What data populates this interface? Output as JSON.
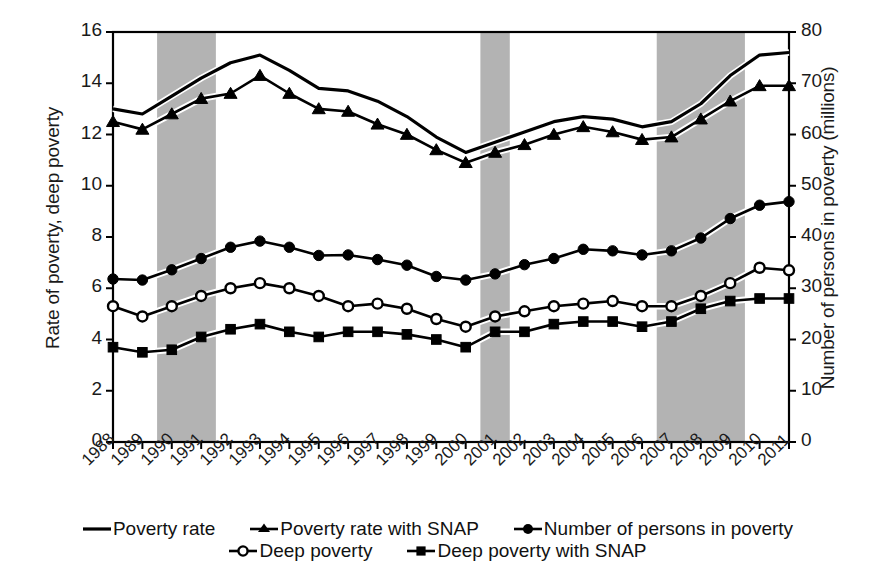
{
  "chart_data": {
    "type": "line",
    "title": "",
    "xlabel": "",
    "ylabel": "Rate of poverty, deep poverty",
    "ylabel_right": "Number of persons in poverty (millions)",
    "ylim": [
      0,
      16
    ],
    "yticks": [
      0,
      2,
      4,
      6,
      8,
      10,
      12,
      14,
      16
    ],
    "ylim_right": [
      0,
      80
    ],
    "yticks_right": [
      0,
      10,
      20,
      30,
      40,
      50,
      60,
      70,
      80
    ],
    "grid": false,
    "legend_position": "bottom",
    "categories": [
      "1988",
      "1989",
      "1990",
      "1991",
      "1992",
      "1993",
      "1994",
      "1995",
      "1996",
      "1997",
      "1998",
      "1999",
      "2000",
      "2001",
      "2002",
      "2003",
      "2004",
      "2005",
      "2006",
      "2007",
      "2008",
      "2009",
      "2010",
      "2011"
    ],
    "shaded_regions": [
      {
        "label": "recession-1990-1991",
        "start": "1990",
        "end": "1991",
        "color": "#b3b3b3"
      },
      {
        "label": "recession-2001",
        "start": "2001",
        "end": "2001",
        "color": "#b3b3b3"
      },
      {
        "label": "recession-2007-2009",
        "start": "2007",
        "end": "2009",
        "color": "#b3b3b3"
      }
    ],
    "series": [
      {
        "name": "Poverty rate",
        "key": "poverty-rate",
        "axis": "left",
        "marker": "none",
        "values": [
          13.0,
          12.8,
          13.5,
          14.2,
          14.8,
          15.1,
          14.5,
          13.8,
          13.7,
          13.3,
          12.7,
          11.9,
          11.3,
          11.7,
          12.1,
          12.5,
          12.7,
          12.6,
          12.3,
          12.5,
          13.2,
          14.3,
          15.1,
          15.2
        ]
      },
      {
        "name": "Poverty rate with SNAP",
        "key": "poverty-rate-with-snap",
        "axis": "left",
        "marker": "triangle",
        "values": [
          12.5,
          12.2,
          12.8,
          13.4,
          13.6,
          14.3,
          13.6,
          13.0,
          12.9,
          12.4,
          12.0,
          11.4,
          10.9,
          11.3,
          11.6,
          12.0,
          12.3,
          12.1,
          11.8,
          11.9,
          12.6,
          13.3,
          13.9,
          13.9
        ]
      },
      {
        "name": "Number of persons in poverty",
        "key": "number-of-persons-in-poverty",
        "axis": "right",
        "marker": "circle-filled",
        "values": [
          31.8,
          31.6,
          33.6,
          35.8,
          38.0,
          39.2,
          38.0,
          36.4,
          36.5,
          35.6,
          34.5,
          32.3,
          31.6,
          32.8,
          34.6,
          35.8,
          37.6,
          37.3,
          36.5,
          37.3,
          39.8,
          43.6,
          46.2,
          46.9
        ]
      },
      {
        "name": "Deep poverty",
        "key": "deep-poverty",
        "axis": "left",
        "marker": "circle-open",
        "values": [
          5.3,
          4.9,
          5.3,
          5.7,
          6.0,
          6.2,
          6.0,
          5.7,
          5.3,
          5.4,
          5.2,
          4.8,
          4.5,
          4.9,
          5.1,
          5.3,
          5.4,
          5.5,
          5.3,
          5.3,
          5.7,
          6.2,
          6.8,
          6.7
        ]
      },
      {
        "name": "Deep poverty with SNAP",
        "key": "deep-poverty-with-snap",
        "axis": "left",
        "marker": "square-filled",
        "values": [
          3.7,
          3.5,
          3.6,
          4.1,
          4.4,
          4.6,
          4.3,
          4.1,
          4.3,
          4.3,
          4.2,
          4.0,
          3.7,
          4.3,
          4.3,
          4.6,
          4.7,
          4.7,
          4.5,
          4.7,
          5.2,
          5.5,
          5.6,
          5.6
        ]
      }
    ]
  },
  "legend": {
    "rows": [
      [
        {
          "label": "Poverty rate",
          "marker": "none"
        },
        {
          "label": "Poverty rate with SNAP",
          "marker": "triangle"
        },
        {
          "label": "Number of persons in poverty",
          "marker": "circle-filled"
        }
      ],
      [
        {
          "label": "Deep poverty",
          "marker": "circle-open"
        },
        {
          "label": "Deep poverty with SNAP",
          "marker": "square-filled"
        }
      ]
    ]
  },
  "colors": {
    "line": "#000000",
    "shade": "#b3b3b3",
    "text": "#1a1a1a",
    "background": "#ffffff"
  }
}
